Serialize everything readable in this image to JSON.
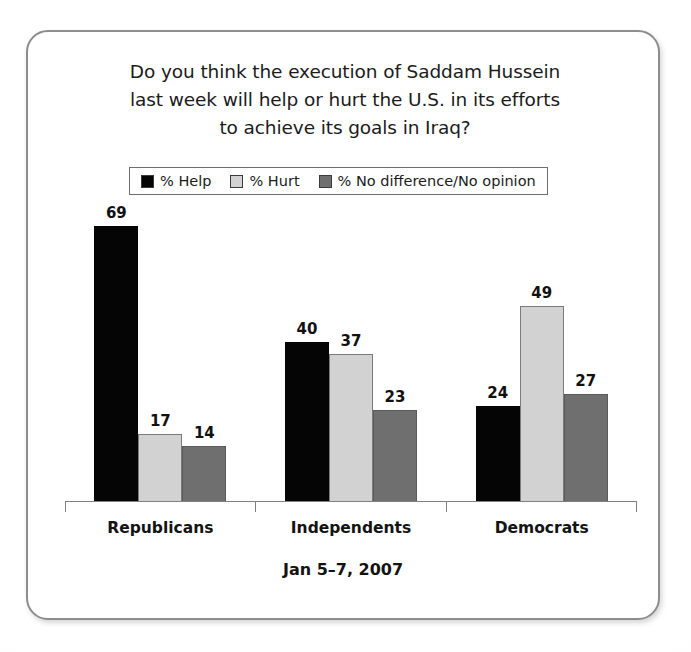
{
  "card": {
    "title_lines": [
      "Do you think the execution of Saddam Hussein",
      "last week will help or hurt the U.S. in its efforts",
      "to achieve its goals in Iraq?"
    ],
    "footer": "Jan 5–7, 2007"
  },
  "legend": {
    "items": [
      {
        "label": "% Help",
        "color": "#050505"
      },
      {
        "label": "% Hurt",
        "color": "#d2d2d2"
      },
      {
        "label": "% No difference/No opinion",
        "color": "#6f6f6f"
      }
    ]
  },
  "chart_data": {
    "type": "bar",
    "title": "Do you think the execution of Saddam Hussein last week will help or hurt the U.S. in its efforts to achieve its goals in Iraq?",
    "subtitle": "Jan 5–7, 2007",
    "xlabel": "",
    "ylabel": "",
    "ylim": [
      0,
      80
    ],
    "grid": false,
    "legend_position": "top-center",
    "categories": [
      "Republicans",
      "Independents",
      "Democrats"
    ],
    "series": [
      {
        "name": "% Help",
        "color": "#050505",
        "values": [
          69,
          40,
          24
        ]
      },
      {
        "name": "% Hurt",
        "color": "#d2d2d2",
        "values": [
          17,
          37,
          49
        ]
      },
      {
        "name": "% No difference/No opinion",
        "color": "#6f6f6f",
        "values": [
          14,
          23,
          27
        ]
      }
    ]
  }
}
